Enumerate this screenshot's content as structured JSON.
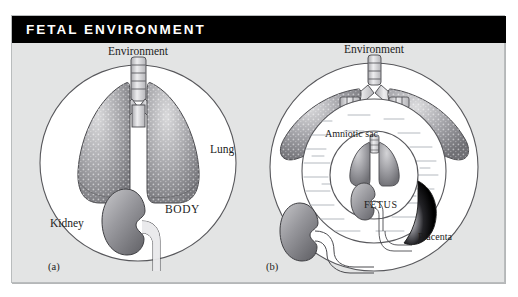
{
  "figure": {
    "title": "FETAL ENVIRONMENT",
    "background_color": "#e3e4e4",
    "title_bar_color": "#000000",
    "title_text_color": "#ffffff"
  },
  "panel_a": {
    "caption": "(a)",
    "labels": {
      "environment": "Environment",
      "lung": "Lung",
      "body": "BODY",
      "kidney": "Kidney"
    }
  },
  "panel_b": {
    "caption": "(b)",
    "labels": {
      "environment": "Environment",
      "amniotic_sac": "Amniotic sac",
      "fetus": "FETUS",
      "placenta": "Placenta"
    }
  },
  "colors": {
    "organ_gray_light": "#d6d6d8",
    "organ_gray_mid": "#9b9b9f",
    "organ_gray_dark": "#6d6d72",
    "placenta_dark": "#0a0a0a",
    "outline": "#3a3a3a",
    "body_fill": "#ffffff",
    "fluid_line": "#b9bdc2"
  }
}
